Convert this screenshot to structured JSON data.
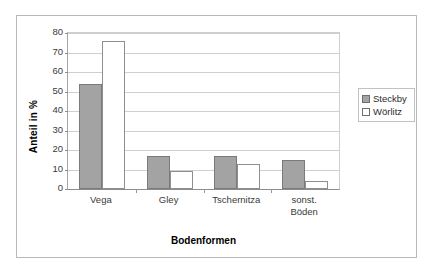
{
  "chart_data": {
    "type": "bar",
    "title": "",
    "xlabel": "Bodenformen",
    "ylabel": "Anteil  in %",
    "categories": [
      "Vega",
      "Gley",
      "Tschernitza",
      "sonst. Böden"
    ],
    "category_lines": [
      [
        "Vega"
      ],
      [
        "Gley"
      ],
      [
        "Tschernitza"
      ],
      [
        "sonst.",
        "Böden"
      ]
    ],
    "series": [
      {
        "name": "Steckby",
        "color": "#a3a3a3",
        "values": [
          54,
          17,
          17,
          15
        ]
      },
      {
        "name": "Wörlitz",
        "color": "#ffffff",
        "values": [
          76,
          9,
          13,
          4
        ]
      }
    ],
    "ylim": [
      0,
      80
    ],
    "yticks": [
      0,
      10,
      20,
      30,
      40,
      50,
      60,
      70,
      80
    ],
    "ytick_labels": [
      "0",
      "10",
      "20",
      "30",
      "40",
      "50",
      "60",
      "70",
      "80"
    ],
    "grid": true,
    "legend_position": "right"
  },
  "legend": {
    "entries": [
      {
        "label": "Steckby"
      },
      {
        "label": "Wörlitz"
      }
    ]
  }
}
